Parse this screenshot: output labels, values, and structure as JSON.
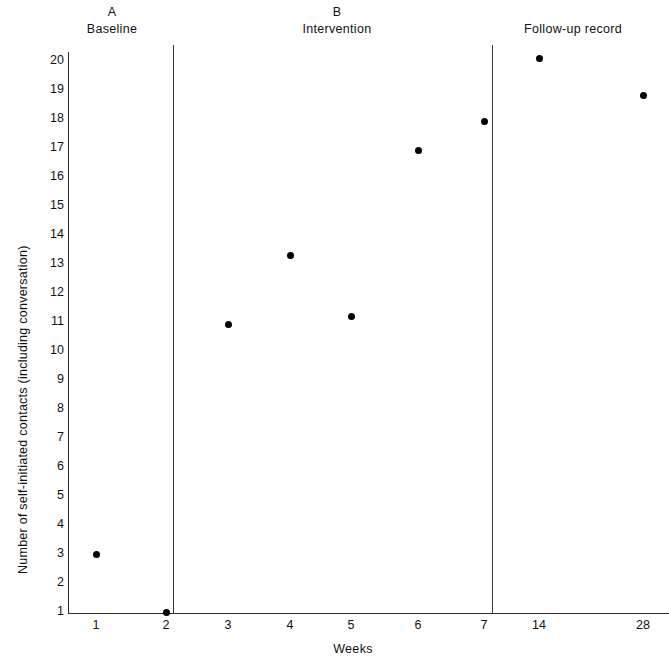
{
  "chart_data": {
    "type": "scatter",
    "title": "",
    "xlabel": "Weeks",
    "ylabel": "Number of self-initiated contacts (including conversation)",
    "x": [
      1,
      2,
      3,
      4,
      5,
      6,
      7,
      14,
      28
    ],
    "values": [
      3,
      1,
      10.9,
      13.3,
      11.2,
      16.9,
      17.9,
      20.1,
      18.8
    ],
    "x_tick_labels": [
      "1",
      "2",
      "3",
      "4",
      "5",
      "6",
      "7",
      "14",
      "28"
    ],
    "y_tick_labels": [
      "20",
      "19",
      "18",
      "17",
      "16",
      "15",
      "14",
      "13",
      "12",
      "11",
      "10",
      "9",
      "8",
      "7",
      "6",
      "5",
      "4",
      "3",
      "2",
      "1"
    ],
    "ylim": [
      1,
      20
    ],
    "grid": false,
    "legend": "none",
    "marker_color": "#000000",
    "axis_color": "#2b2b2b",
    "phases": [
      {
        "letter": "A",
        "name": "Baseline"
      },
      {
        "letter": "B",
        "name": "Intervention"
      },
      {
        "letter": "",
        "name": "Follow-up record"
      }
    ],
    "phase_dividers": [
      2.1,
      7.05
    ]
  }
}
